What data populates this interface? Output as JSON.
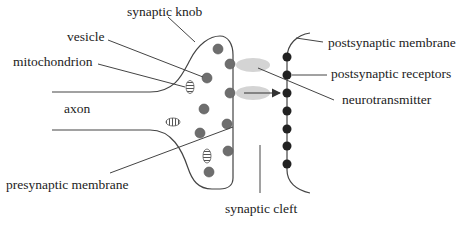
{
  "diagram": {
    "labels": {
      "synaptic_knob": "synaptic knob",
      "vesicle": "vesicle",
      "mitochondrion": "mitochondrion",
      "axon": "axon",
      "presynaptic_membrane": "presynaptic membrane",
      "synaptic_cleft": "synaptic cleft",
      "postsynaptic_membrane": "postsynaptic membrane",
      "postsynaptic_receptors": "postsynaptic receptors",
      "neurotransmitter": "neurotransmitter"
    },
    "colors": {
      "line": "#444444",
      "vesicle": "#6e6e6e",
      "receptor": "#222222",
      "neurotransmitter_cloud": "#d4d4d4"
    }
  }
}
